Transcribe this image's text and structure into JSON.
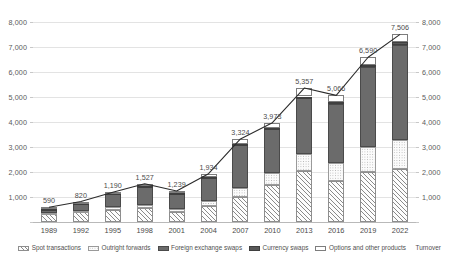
{
  "chart_data": {
    "type": "bar",
    "stacked": true,
    "title": "",
    "subtitle": "",
    "xlabel": "",
    "ylabel": "",
    "ylim": [
      0,
      8000
    ],
    "y_ticks": [
      "0",
      "1,000",
      "2,000",
      "3,000",
      "4,000",
      "5,000",
      "6,000",
      "7,000",
      "8,000"
    ],
    "y_tick_values": [
      0,
      1000,
      2000,
      3000,
      4000,
      5000,
      6000,
      7000,
      8000
    ],
    "dual_axis": true,
    "grid": true,
    "legend_position": "bottom",
    "categories": [
      "1989",
      "1992",
      "1995",
      "1998",
      "2001",
      "2004",
      "2007",
      "2010",
      "2013",
      "2016",
      "2019",
      "2022"
    ],
    "series": [
      {
        "name": "Spot transactions",
        "key": "spot",
        "values": [
          317,
          394,
          494,
          568,
          386,
          631,
          1005,
          1488,
          2047,
          1652,
          1987,
          2104
        ]
      },
      {
        "name": "Outright forwards",
        "key": "forward",
        "values": [
          27,
          58,
          97,
          128,
          130,
          209,
          362,
          475,
          679,
          700,
          999,
          1163
        ]
      },
      {
        "name": "Foreign exchange swaps",
        "key": "fxswap",
        "values": [
          190,
          324,
          546,
          734,
          656,
          954,
          1714,
          1759,
          2240,
          2378,
          3203,
          3811
        ]
      },
      {
        "name": "Currency swaps",
        "key": "ccyswap",
        "values": [
          4,
          4,
          15,
          10,
          7,
          21,
          31,
          43,
          54,
          82,
          108,
          124
        ]
      },
      {
        "name": "Options and other products",
        "key": "options",
        "values": [
          52,
          40,
          38,
          87,
          60,
          119,
          212,
          207,
          337,
          254,
          294,
          304
        ]
      }
    ],
    "line_series": {
      "name": "Turnover",
      "values": [
        590,
        820,
        1190,
        1527,
        1239,
        1934,
        3324,
        3973,
        5357,
        5066,
        6590,
        7506
      ],
      "labels": [
        "590",
        "820",
        "1,190",
        "1,527",
        "1,239",
        "1,934",
        "3,324",
        "3,973",
        "5,357",
        "5,066",
        "6,590",
        "7,506"
      ],
      "color": "#2b2b2b"
    }
  },
  "legend": {
    "items": [
      {
        "label": "Spot transactions",
        "key": "spot"
      },
      {
        "label": "Outright forwards",
        "key": "forward"
      },
      {
        "label": "Foreign exchange swaps",
        "key": "fxswap"
      },
      {
        "label": "Currency swaps",
        "key": "ccyswap"
      },
      {
        "label": "Options and other products",
        "key": "options"
      },
      {
        "label": "Turnover",
        "key": "line"
      }
    ]
  }
}
